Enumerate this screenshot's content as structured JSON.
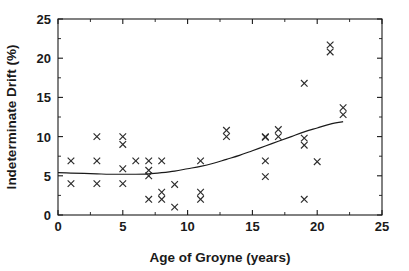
{
  "chart_data": {
    "type": "scatter",
    "title": "",
    "xlabel": "Age of Groyne (years)",
    "ylabel": "Indeterminate Drift (%)",
    "xlim": [
      0,
      25
    ],
    "ylim": [
      0,
      25
    ],
    "xticks": [
      0,
      5,
      10,
      15,
      20,
      25
    ],
    "xticklabels": [
      "0",
      "5",
      "10",
      "15",
      "20",
      "25"
    ],
    "yticks": [
      0,
      5,
      10,
      15,
      20,
      25
    ],
    "yticklabels": [
      "0",
      "5",
      "10",
      "15",
      "20",
      "25"
    ],
    "xminor_ticks": [
      2.5,
      7.5,
      12.5,
      17.5,
      22.5
    ],
    "yminor_ticks": [
      2.5,
      7.5,
      12.5,
      17.5,
      22.5
    ],
    "grid": false,
    "legend": null,
    "marker_style": "x",
    "marker_color": "#2b2b2b",
    "series": [
      {
        "name": "Indeterminate drift observations",
        "marker": "x",
        "points": [
          [
            1,
            6.9
          ],
          [
            1,
            4.0
          ],
          [
            3,
            10.0
          ],
          [
            3,
            6.9
          ],
          [
            3,
            4.0
          ],
          [
            5,
            10.0
          ],
          [
            5,
            9.0
          ],
          [
            5,
            5.9
          ],
          [
            5,
            4.0
          ],
          [
            6,
            6.9
          ],
          [
            7,
            6.9
          ],
          [
            7,
            5.7
          ],
          [
            7,
            5.0
          ],
          [
            7,
            2.0
          ],
          [
            8,
            6.9
          ],
          [
            8,
            2.9
          ],
          [
            8,
            2.0
          ],
          [
            9,
            3.9
          ],
          [
            9,
            1.0
          ],
          [
            11,
            6.9
          ],
          [
            11,
            2.9
          ],
          [
            11,
            2.0
          ],
          [
            13,
            10.8
          ],
          [
            13,
            10.0
          ],
          [
            16,
            10.0
          ],
          [
            16,
            9.9
          ],
          [
            16,
            6.9
          ],
          [
            16,
            4.9
          ],
          [
            17,
            10.9
          ],
          [
            17,
            10.0
          ],
          [
            19,
            16.8
          ],
          [
            19,
            9.8
          ],
          [
            19,
            8.9
          ],
          [
            19,
            2.0
          ],
          [
            20,
            6.8
          ],
          [
            21,
            21.7
          ],
          [
            21,
            20.8
          ],
          [
            22,
            13.7
          ],
          [
            22,
            12.8
          ]
        ]
      }
    ],
    "fit_curve": {
      "name": "fitted trend",
      "style": "solid",
      "color": "#1a1a1a",
      "x_range": [
        0,
        22
      ],
      "points": [
        [
          0,
          5.4
        ],
        [
          1,
          5.35
        ],
        [
          2,
          5.3
        ],
        [
          3,
          5.25
        ],
        [
          4,
          5.2
        ],
        [
          5,
          5.2
        ],
        [
          6,
          5.2
        ],
        [
          7,
          5.25
        ],
        [
          8,
          5.4
        ],
        [
          9,
          5.6
        ],
        [
          10,
          5.9
        ],
        [
          11,
          6.2
        ],
        [
          12,
          6.6
        ],
        [
          13,
          7.1
        ],
        [
          14,
          7.6
        ],
        [
          15,
          8.2
        ],
        [
          16,
          8.8
        ],
        [
          17,
          9.4
        ],
        [
          18,
          10.0
        ],
        [
          19,
          10.6
        ],
        [
          20,
          11.1
        ],
        [
          21,
          11.6
        ],
        [
          22,
          11.9
        ]
      ]
    }
  },
  "axes": {
    "x_title": "Age of Groyne (years)",
    "y_title": "Indeterminate Drift (%)"
  }
}
